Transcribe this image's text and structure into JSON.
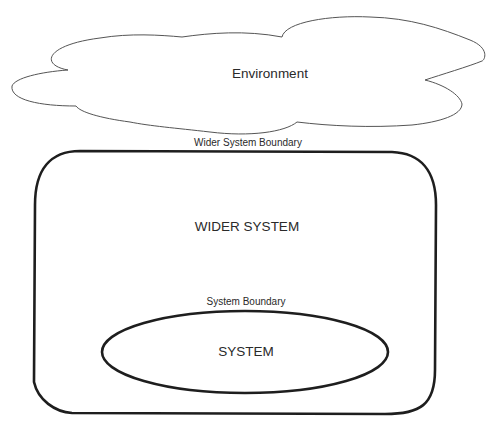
{
  "diagram": {
    "environment": {
      "label": "Environment",
      "shape": "cloud"
    },
    "wider_system_boundary": {
      "label": "Wider System Boundary"
    },
    "wider_system": {
      "label": "WIDER SYSTEM",
      "shape": "rounded-rectangle"
    },
    "system_boundary": {
      "label": "System Boundary"
    },
    "system": {
      "label": "SYSTEM",
      "shape": "ellipse"
    }
  },
  "colors": {
    "stroke": "#1e1e1e",
    "cloud_stroke": "#555555",
    "text": "#2a2a2a",
    "background": "#ffffff"
  }
}
